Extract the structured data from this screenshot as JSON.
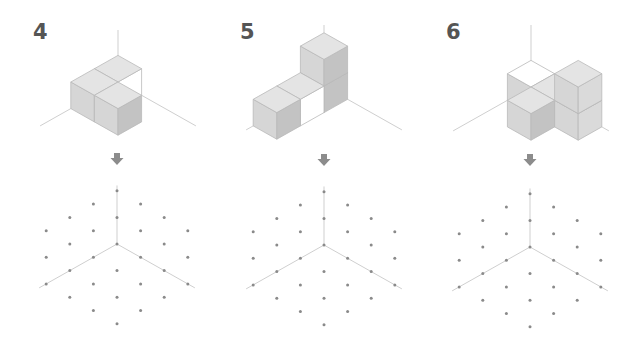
{
  "colors": {
    "axis": "#cfcfcf",
    "edge": "#b9b9b9",
    "top": "#e4e4e4",
    "left": "#d6d6d6",
    "right_dark": "#c3c3c3",
    "right_light": "#dadada",
    "hollow": "#ffffff",
    "dot": "#8a8a8a",
    "arrow": "#8c8c8c",
    "label": "#555555"
  },
  "iso": {
    "dx": 23.6,
    "dy": 13.3
  },
  "panels": [
    {
      "label": "4",
      "label_x": 33,
      "origin": [
        118,
        82
      ],
      "axis_top": 30,
      "axis_floor_len": 3.3,
      "cubes": [
        {
          "i": 0,
          "j": 0,
          "k": 0,
          "top": "top",
          "left": "left",
          "right": "hollow"
        },
        {
          "i": 0,
          "j": 1,
          "k": 0,
          "top": "top",
          "left": "left",
          "right": "left"
        },
        {
          "i": 1,
          "j": 1,
          "k": 0,
          "top": "top",
          "left": "left",
          "right": "right_dark"
        }
      ],
      "arrow": [
        117,
        153
      ],
      "grid_center": [
        117,
        244
      ]
    },
    {
      "label": "5",
      "label_x": 240,
      "origin": [
        324,
        86
      ],
      "axis_top": 25,
      "axis_floor_len": 3.3,
      "cubes": [
        {
          "i": 0,
          "j": 0,
          "k": 0,
          "top": "top",
          "left": "left",
          "right": "right_dark"
        },
        {
          "i": 0,
          "j": 0,
          "k": 1,
          "top": "top",
          "left": "left",
          "right": "right_dark"
        },
        {
          "i": 0,
          "j": 1,
          "k": 0,
          "top": "top",
          "left": "left",
          "right": "hollow"
        },
        {
          "i": 0,
          "j": 2,
          "k": 0,
          "top": "top",
          "left": "left",
          "right": "right_dark"
        }
      ],
      "arrow": [
        324,
        154
      ],
      "grid_center": [
        324,
        245
      ]
    },
    {
      "label": "6",
      "label_x": 446,
      "origin": [
        531,
        87
      ],
      "axis_top": 25,
      "axis_floor_len": 3.3,
      "cubes": [
        {
          "i": 0,
          "j": 0,
          "k": 0,
          "top": "hollow",
          "left": "left",
          "right": "left"
        },
        {
          "i": 1,
          "j": 0,
          "k": 0,
          "top": "top",
          "left": "left",
          "right": "right_light"
        },
        {
          "i": 2,
          "j": 0,
          "k": 0,
          "top": "top",
          "left": "left",
          "right": "right_light"
        },
        {
          "i": 2,
          "j": 0,
          "k": 1,
          "top": "top",
          "left": "left",
          "right": "right_light"
        },
        {
          "i": 1,
          "j": 1,
          "k": 0,
          "top": "top",
          "left": "left",
          "right": "right_dark"
        }
      ],
      "arrow": [
        530,
        154
      ],
      "grid_center": [
        530,
        247
      ]
    }
  ],
  "grid": {
    "columns": [
      {
        "col": -3,
        "rows": [
          -1,
          1,
          3
        ]
      },
      {
        "col": -2,
        "rows": [
          -2,
          0,
          2,
          4
        ]
      },
      {
        "col": -1,
        "rows": [
          -3,
          -1,
          1,
          3,
          5
        ]
      },
      {
        "col": 0,
        "rows": [
          -4,
          -2,
          0,
          2,
          4,
          6
        ]
      },
      {
        "col": 1,
        "rows": [
          -3,
          -1,
          1,
          3,
          5
        ]
      },
      {
        "col": 2,
        "rows": [
          -2,
          0,
          2,
          4
        ]
      },
      {
        "col": 3,
        "rows": [
          -1,
          1,
          3
        ]
      }
    ],
    "axis_len_units": 3.3,
    "axis_up_units": 4.4
  }
}
